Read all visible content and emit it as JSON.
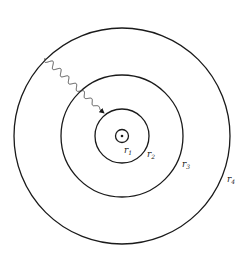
{
  "diagram": {
    "stroke_color": "#1a1a1a",
    "background": "#ffffff",
    "circles": [
      {
        "id": "r1",
        "label": "r",
        "subscript": "1"
      },
      {
        "id": "r2",
        "label": "r",
        "subscript": "2"
      },
      {
        "id": "r3",
        "label": "r",
        "subscript": "3"
      },
      {
        "id": "r4",
        "label": "r",
        "subscript": "4"
      }
    ],
    "center_marker": "dot",
    "arrow": {
      "type": "wavy",
      "direction": "inward"
    }
  }
}
